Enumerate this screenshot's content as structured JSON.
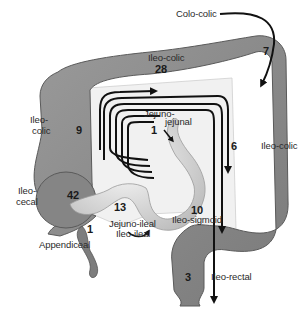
{
  "diagram": {
    "colors": {
      "colon_fill": "#8e8e8e",
      "colon_shade": "#6f6f6f",
      "colon_edge": "#5a5a5a",
      "small_bowel_fill": "#e6e6e6",
      "mesentery_fill": "#f1f1f1",
      "arrow": "#111111",
      "text": "#2a2a2a"
    },
    "labels": [
      {
        "id": "colo-colic",
        "text": "Colo-colic",
        "count": "7"
      },
      {
        "id": "ileo-colic-transverse",
        "text": "Ileo-colic",
        "count": "28"
      },
      {
        "id": "ileo-colic-left",
        "text_line1": "Ileo-",
        "text_line2": "colic",
        "count": "9"
      },
      {
        "id": "ileo-colic-right",
        "text": "Ileo-colic",
        "count": "6"
      },
      {
        "id": "jejuno-jejunal",
        "text_line1": "Jejuno-",
        "text_line2": "jejunal",
        "count": "1"
      },
      {
        "id": "ileo-cecal",
        "text_line1": "Ileo-",
        "text_line2": "cecal",
        "count": "42"
      },
      {
        "id": "jejuno-ileal",
        "text_line1": "Jejuno-ileal",
        "text_line2": "Ileo-ileal",
        "count": "13"
      },
      {
        "id": "appendiceal",
        "text": "Appendiceal",
        "count": "1"
      },
      {
        "id": "ileo-sigmoid",
        "text": "Ileo-sigmoid",
        "count": "10"
      },
      {
        "id": "ileo-rectal",
        "text": "Ileo-rectal",
        "count": "3"
      }
    ]
  }
}
